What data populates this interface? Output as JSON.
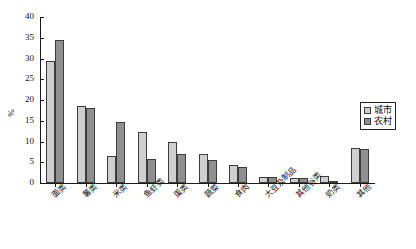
{
  "chart_data": {
    "type": "bar",
    "title": "",
    "xlabel": "",
    "ylabel": "%",
    "ylim": [
      0,
      40
    ],
    "yticks": [
      0,
      5,
      10,
      15,
      20,
      25,
      30,
      35,
      40
    ],
    "grid": false,
    "legend_position": "right",
    "categories": [
      "面类",
      "薯类",
      "米类",
      "鱼虾类",
      "蛋类",
      "蔬菜",
      "食肉",
      "大豆及制品",
      "其他谷类",
      "奶类",
      "其他"
    ],
    "series": [
      {
        "name": "城市",
        "color": "#cfcfcf",
        "values": [
          29.5,
          18.6,
          6.4,
          12.3,
          9.8,
          6.9,
          4.3,
          1.5,
          1.1,
          1.6,
          8.4
        ]
      },
      {
        "name": "农村",
        "color": "#8f8f8f",
        "values": [
          34.5,
          18.0,
          14.8,
          5.7,
          7.0,
          5.6,
          3.8,
          1.4,
          1.2,
          0.3,
          8.1
        ]
      }
    ]
  },
  "legend": {
    "items": [
      {
        "label": "城市"
      },
      {
        "label": "农村"
      }
    ]
  }
}
